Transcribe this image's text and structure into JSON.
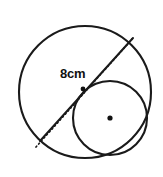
{
  "figure": {
    "canvas": {
      "width": 163,
      "height": 177,
      "background": "#ffffff"
    },
    "stroke_color": "#1a1a1a",
    "label_color": "#111111",
    "measurement_label": "8cm",
    "shapes": {
      "outer_circle": {
        "name": "large-circle",
        "cx": 85,
        "cy": 92,
        "r": 66,
        "stroke_width": 2.1
      },
      "inner_circle": {
        "name": "small-circle",
        "cx": 110,
        "cy": 118,
        "r": 37,
        "stroke_width": 2.1
      },
      "inner_circle_center_dot": {
        "name": "small-circle-center-dot",
        "cx": 110,
        "cy": 118,
        "r": 2.6
      },
      "tangent_point_dot": {
        "name": "tangent-point-dot",
        "cx": 83,
        "cy": 89,
        "r": 2.4
      },
      "dotted_diameter": {
        "name": "dotted-diameter-line",
        "x1": 36,
        "y1": 147,
        "x2": 133,
        "y2": 38,
        "stroke_width": 1.7,
        "dash": "1,3"
      },
      "solid_chord": {
        "name": "solid-chord-line",
        "x1": 40,
        "y1": 141,
        "x2": 133,
        "y2": 38,
        "stroke_width": 2.0
      }
    },
    "label_position": {
      "x": 60,
      "y": 78
    }
  }
}
